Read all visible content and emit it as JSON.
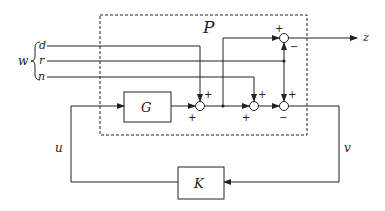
{
  "diagram": {
    "type": "block-diagram",
    "plant_label": "P",
    "blocks": [
      {
        "id": "G",
        "label": "G"
      },
      {
        "id": "K",
        "label": "K"
      }
    ],
    "signals": {
      "w": "w",
      "d": "d",
      "r": "r",
      "n": "n",
      "z": "z",
      "u": "u",
      "v": "v"
    },
    "summing_junctions": [
      {
        "id": "sum-top",
        "signs": [
          "+",
          "−"
        ]
      },
      {
        "id": "sum-1",
        "signs": [
          "+",
          "+"
        ]
      },
      {
        "id": "sum-2",
        "signs": [
          "+",
          "+"
        ]
      },
      {
        "id": "sum-3",
        "signs": [
          "+",
          "−"
        ]
      }
    ],
    "colors": {
      "line": "#222222",
      "background": "#ffffff"
    }
  }
}
